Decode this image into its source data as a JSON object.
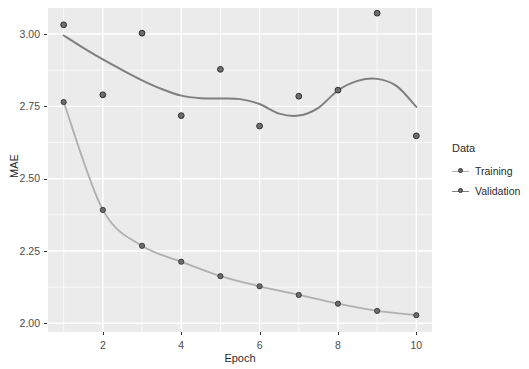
{
  "chart_data": {
    "type": "line",
    "title": "",
    "subtitle": "",
    "xlabel": "Epoch",
    "ylabel": "MAE",
    "xlim": [
      0.6,
      10.4
    ],
    "ylim": [
      1.97,
      3.09
    ],
    "grid": true,
    "legend_position": "right",
    "legend_title": "Data",
    "x": [
      1,
      2,
      3,
      4,
      5,
      6,
      7,
      8,
      9,
      10
    ],
    "xticks": [
      "2",
      "4",
      "6",
      "8",
      "10"
    ],
    "xtick_values": [
      2,
      4,
      6,
      8,
      10
    ],
    "yticks": [
      "3.00",
      "2.75",
      "2.50",
      "2.25",
      "2.00"
    ],
    "ytick_values": [
      3.0,
      2.75,
      2.5,
      2.25,
      2.0
    ],
    "series": [
      {
        "name": "Training",
        "color": "#b0b0b0",
        "point_color": "#6e6e6e",
        "values": [
          2.765,
          2.392,
          2.268,
          2.213,
          2.163,
          2.128,
          2.098,
          2.068,
          2.043,
          2.028
        ]
      },
      {
        "name": "Validation",
        "color": "#7f7f7f",
        "point_color": "#6e6e6e",
        "values": [
          3.032,
          2.79,
          3.003,
          2.718,
          2.878,
          2.682,
          2.785,
          2.806,
          3.072,
          2.648
        ]
      }
    ],
    "validation_smooth_curve": [
      [
        1,
        2.995
      ],
      [
        1.5,
        2.952
      ],
      [
        2,
        2.912
      ],
      [
        2.5,
        2.875
      ],
      [
        3,
        2.84
      ],
      [
        3.5,
        2.81
      ],
      [
        4,
        2.787
      ],
      [
        4.5,
        2.778
      ],
      [
        5,
        2.777
      ],
      [
        5.5,
        2.775
      ],
      [
        6,
        2.758
      ],
      [
        6.5,
        2.725
      ],
      [
        7,
        2.718
      ],
      [
        7.5,
        2.745
      ],
      [
        8,
        2.805
      ],
      [
        8.5,
        2.838
      ],
      [
        9,
        2.845
      ],
      [
        9.5,
        2.82
      ],
      [
        10,
        2.748
      ]
    ],
    "panel_background": "#ebebeb",
    "gridline_color": "#ffffff",
    "text_color": "#4d4d4d"
  },
  "legend": {
    "title": "Data",
    "items": [
      {
        "label": "Training",
        "color": "#b0b0b0"
      },
      {
        "label": "Validation",
        "color": "#7f7f7f"
      }
    ]
  },
  "axes": {
    "y_title": "MAE",
    "x_title": "Epoch"
  }
}
